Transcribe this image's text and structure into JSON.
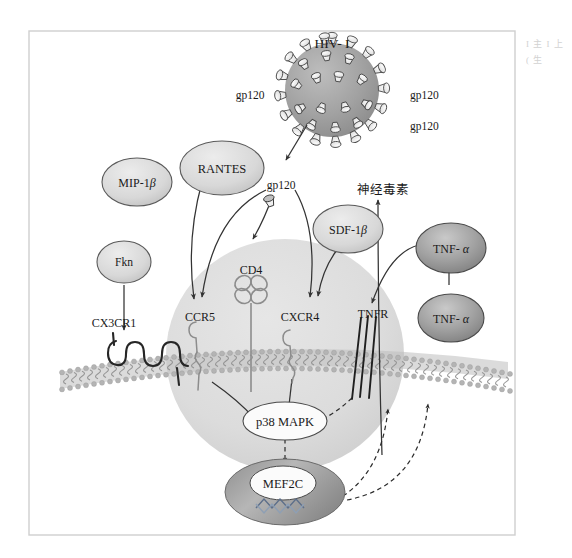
{
  "figure": {
    "title_virus": "HIV- I",
    "neurotoxin_label": "神经毒素",
    "gp120_labels": {
      "left": "gp120",
      "right_upper": "gp120",
      "right_lower": "gp120",
      "center": "gp120"
    },
    "ligands": [
      {
        "id": "mip1b",
        "label": "MIP-1",
        "greek": "β",
        "fill": "#d9d9d9"
      },
      {
        "id": "rantes",
        "label": "RANTES",
        "greek": "",
        "fill": "#d2d2d2"
      },
      {
        "id": "fkn",
        "label": "Fkn",
        "greek": "",
        "fill": "#dcdcdc"
      },
      {
        "id": "sdf1b",
        "label": "SDF-1",
        "greek": "β",
        "fill": "#d9d9d9"
      },
      {
        "id": "tnfa_up",
        "label": "TNF- ",
        "greek": "α",
        "fill": "#9a9a9a"
      },
      {
        "id": "tnfa_lo",
        "label": "TNF- ",
        "greek": "α",
        "fill": "#a5a5a5"
      }
    ],
    "receptors": [
      {
        "id": "cx3cr1",
        "label": "CX3CR1"
      },
      {
        "id": "ccr5",
        "label": "CCR5"
      },
      {
        "id": "cd4",
        "label": "CD4"
      },
      {
        "id": "cxcr4",
        "label": "CXCR4"
      },
      {
        "id": "tnfr",
        "label": "TNFR"
      }
    ],
    "intracellular": [
      {
        "id": "p38",
        "label": "p38 MAPK"
      },
      {
        "id": "mef2c",
        "label": "MEF2C"
      }
    ],
    "colors": {
      "virion_body": "#9d9d9d",
      "cell_body": "#dcdcdc",
      "membrane": "#b0b0b0",
      "nucleus": "#a8a8a8",
      "frame": "#cfcfcf",
      "stroke": "#444444"
    },
    "margin_text": "I 主 I 上 ( 生"
  }
}
